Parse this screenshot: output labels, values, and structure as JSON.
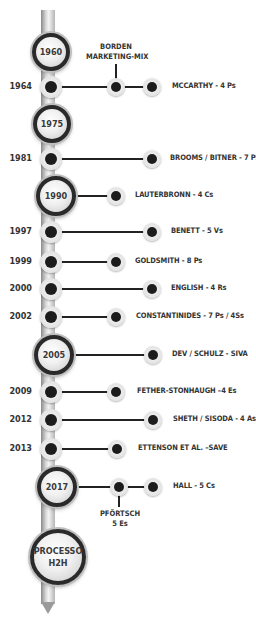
{
  "colors": {
    "line": "#222222",
    "node_dark": "#1c1c1c",
    "text": "#333333",
    "ring": "#2a2a2a"
  },
  "milestones": [
    {
      "year": "1960"
    },
    {
      "year": "1975"
    },
    {
      "year": "1990"
    },
    {
      "year": "2005"
    },
    {
      "year": "2017"
    }
  ],
  "final_node": {
    "line1": "PROCESSO",
    "line2": "H2H"
  },
  "events": [
    {
      "year": "1964",
      "label": "MCCARTHY - 4 Ps"
    },
    {
      "year": "1981",
      "label": "BROOMS / BITNER - 7 Ps"
    },
    {
      "year": "1990",
      "label": "LAUTERBRONN - 4 Cs"
    },
    {
      "year": "1997",
      "label": "BENETT - 5 Vs"
    },
    {
      "year": "1999",
      "label": "GOLDSMITH - 8 Ps"
    },
    {
      "year": "2000",
      "label": "ENGLISH - 4 Rs"
    },
    {
      "year": "2002",
      "label": "CONSTANTINIDES - 7 Ps / 4Ss"
    },
    {
      "year": "2005",
      "label": "DEV / SCHULZ - SIVA"
    },
    {
      "year": "2009",
      "label": "FETHER-STONHAUGH –4 Es"
    },
    {
      "year": "2012",
      "label": "SHETH / SISODA - 4 As"
    },
    {
      "year": "2013",
      "label": "ETTENSON ET AL. –SAVE"
    },
    {
      "year": "2017",
      "label": "HALL - 5 Cs"
    }
  ],
  "branch_labels": {
    "borden_line1": "BORDEN",
    "borden_line2": "MARKETING-MIX",
    "pfortsch_line1": "PFÖRTSCH",
    "pfortsch_line2": "5 Es"
  }
}
